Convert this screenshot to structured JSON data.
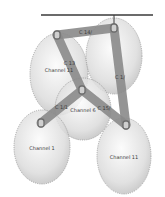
{
  "diagram": {
    "title": "",
    "colors": {
      "bubble_fill": "#d8d8d8",
      "bubble_stroke": "#9a9a9a",
      "rod": "#8a8a8a",
      "node": "#6e6e6e",
      "bar": "#3a3a3a"
    },
    "bubbles": [
      {
        "id": "b1",
        "label": "Channel 11",
        "cx": 59,
        "cy": 74,
        "rx": 29,
        "ry": 41
      },
      {
        "id": "b2",
        "label": "",
        "cx": 114,
        "cy": 56,
        "rx": 28,
        "ry": 38
      },
      {
        "id": "b3",
        "label": "Channel 6",
        "cx": 83,
        "cy": 109,
        "rx": 28,
        "ry": 31
      },
      {
        "id": "b4",
        "label": "Channel 1",
        "cx": 42,
        "cy": 147,
        "rx": 28,
        "ry": 37
      },
      {
        "id": "b5",
        "label": "Channel 11",
        "cx": 124,
        "cy": 156,
        "rx": 27,
        "ry": 38
      }
    ],
    "rods": [
      {
        "id": "r1",
        "label": "C 14/",
        "x1": 57,
        "y1": 35,
        "x2": 114,
        "y2": 28
      },
      {
        "id": "r2",
        "label": "C 13",
        "x1": 57,
        "y1": 35,
        "x2": 82,
        "y2": 90
      },
      {
        "id": "r3",
        "label": "C 1/",
        "x1": 114,
        "y1": 28,
        "x2": 126,
        "y2": 125
      },
      {
        "id": "r4",
        "label": "C 1/1",
        "x1": 82,
        "y1": 90,
        "x2": 41,
        "y2": 123
      },
      {
        "id": "r5",
        "label": "C 15/",
        "x1": 82,
        "y1": 90,
        "x2": 126,
        "y2": 125
      }
    ],
    "nodes": [
      {
        "id": "n1",
        "x": 57,
        "y": 35
      },
      {
        "id": "n2",
        "x": 114,
        "y": 28
      },
      {
        "id": "n3",
        "x": 82,
        "y": 90
      },
      {
        "id": "n4",
        "x": 41,
        "y": 123
      },
      {
        "id": "n5",
        "x": 126,
        "y": 125
      }
    ],
    "bar": {
      "x1": 41,
      "y1": 15,
      "x2": 153,
      "y2": 15,
      "stem_x": 114,
      "stem_y2": 24
    }
  }
}
